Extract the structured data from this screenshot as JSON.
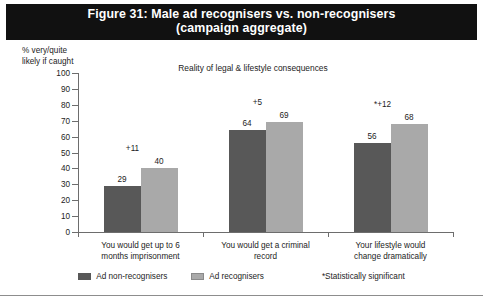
{
  "title": {
    "line1": "Figure 31: Male ad recognisers vs. non-recognisers",
    "line2": "(campaign aggregate)"
  },
  "y_caption": "% very/quite\nlikely if caught",
  "legend": {
    "items": [
      {
        "label": "Ad non-recognisers",
        "color": "#585858"
      },
      {
        "label": "Ad recognisers",
        "color": "#a9a9a9"
      }
    ],
    "footnote": "*Statistically significant"
  },
  "chart_data": {
    "type": "bar",
    "title": "Figure 31: Male ad recognisers vs. non-recognisers (campaign aggregate)",
    "subtitle": "Reality of legal & lifestyle consequences",
    "xlabel": "",
    "ylabel": "% very/quite likely if caught",
    "ylim": [
      0,
      100
    ],
    "yticks": [
      0,
      10,
      20,
      30,
      40,
      50,
      60,
      70,
      80,
      90,
      100
    ],
    "ytick_labels": [
      "0",
      "10",
      "20",
      "30",
      "40",
      "50",
      "60",
      "70",
      "80",
      "90",
      "100"
    ],
    "grid": false,
    "legend_position": "bottom",
    "categories": [
      "You would get up to 6\nmonths imprisonment",
      "You would get a criminal\nrecord",
      "Your lifestyle would\nchange dramatically"
    ],
    "series": [
      {
        "name": "Ad non-recognisers",
        "color": "#585858",
        "values": [
          29,
          64,
          56
        ]
      },
      {
        "name": "Ad recognisers",
        "color": "#a9a9a9",
        "values": [
          40,
          69,
          68
        ]
      }
    ],
    "annotations": [
      {
        "category_index": 0,
        "text": "+11",
        "value": 11,
        "significant": false
      },
      {
        "category_index": 1,
        "text": "+5",
        "value": 5,
        "significant": false
      },
      {
        "category_index": 2,
        "text": "*+12",
        "value": 12,
        "significant": true
      }
    ]
  }
}
